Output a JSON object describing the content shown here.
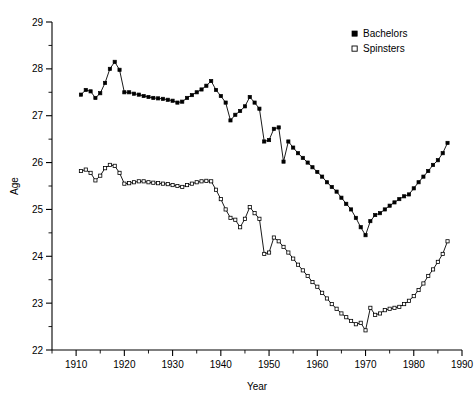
{
  "chart_data": {
    "type": "line",
    "title": "",
    "xlabel": "Year",
    "ylabel": "Age",
    "xlim": [
      1905,
      1990
    ],
    "ylim": [
      22,
      29
    ],
    "grid": false,
    "legend_position": "top-right",
    "x_ticks": [
      1910,
      1920,
      1930,
      1940,
      1950,
      1960,
      1970,
      1980,
      1990
    ],
    "x_minor_step": 5,
    "y_ticks": [
      22,
      23,
      24,
      25,
      26,
      27,
      28,
      29
    ],
    "y_minor_step": 0.5,
    "x": [
      1911,
      1912,
      1913,
      1914,
      1915,
      1916,
      1917,
      1918,
      1919,
      1920,
      1921,
      1922,
      1923,
      1924,
      1925,
      1926,
      1927,
      1928,
      1929,
      1930,
      1931,
      1932,
      1933,
      1934,
      1935,
      1936,
      1937,
      1938,
      1939,
      1940,
      1941,
      1942,
      1943,
      1944,
      1945,
      1946,
      1947,
      1948,
      1949,
      1950,
      1951,
      1952,
      1953,
      1954,
      1955,
      1956,
      1957,
      1958,
      1959,
      1960,
      1961,
      1962,
      1963,
      1964,
      1965,
      1966,
      1967,
      1968,
      1969,
      1970,
      1971,
      1972,
      1973,
      1974,
      1975,
      1976,
      1977,
      1978,
      1979,
      1980,
      1981,
      1982,
      1983,
      1984,
      1985,
      1986,
      1987
    ],
    "series": [
      {
        "name": "Bachelors",
        "marker": "filled-square",
        "color": "#000000",
        "values": [
          27.45,
          27.55,
          27.52,
          27.38,
          27.48,
          27.7,
          28.0,
          28.15,
          27.98,
          27.5,
          27.5,
          27.47,
          27.45,
          27.42,
          27.4,
          27.38,
          27.37,
          27.36,
          27.34,
          27.32,
          27.28,
          27.3,
          27.38,
          27.44,
          27.5,
          27.56,
          27.64,
          27.74,
          27.55,
          27.42,
          27.28,
          26.9,
          27.02,
          27.1,
          27.2,
          27.4,
          27.28,
          27.15,
          26.45,
          26.48,
          26.72,
          26.75,
          26.02,
          26.45,
          26.32,
          26.2,
          26.1,
          26.0,
          25.9,
          25.8,
          25.7,
          25.58,
          25.48,
          25.38,
          25.25,
          25.12,
          25.0,
          24.82,
          24.62,
          24.45,
          24.75,
          24.88,
          24.92,
          25.0,
          25.08,
          25.15,
          25.22,
          25.28,
          25.32,
          25.45,
          25.58,
          25.7,
          25.82,
          25.95,
          26.05,
          26.2,
          26.42
        ]
      },
      {
        "name": "Spinsters",
        "marker": "open-square",
        "color": "#000000",
        "values": [
          25.82,
          25.85,
          25.78,
          25.62,
          25.72,
          25.88,
          25.95,
          25.93,
          25.78,
          25.55,
          25.56,
          25.58,
          25.6,
          25.6,
          25.58,
          25.57,
          25.56,
          25.55,
          25.54,
          25.52,
          25.5,
          25.48,
          25.52,
          25.55,
          25.58,
          25.6,
          25.61,
          25.6,
          25.42,
          25.22,
          25.0,
          24.82,
          24.78,
          24.62,
          24.8,
          25.05,
          24.92,
          24.8,
          24.05,
          24.08,
          24.4,
          24.32,
          24.2,
          24.08,
          23.95,
          23.82,
          23.7,
          23.58,
          23.45,
          23.35,
          23.22,
          23.1,
          22.98,
          22.88,
          22.78,
          22.7,
          22.62,
          22.55,
          22.58,
          22.42,
          22.9,
          22.75,
          22.78,
          22.85,
          22.88,
          22.9,
          22.92,
          22.98,
          23.05,
          23.15,
          23.28,
          23.42,
          23.58,
          23.72,
          23.88,
          24.05,
          24.32
        ]
      }
    ]
  },
  "legend": {
    "entries": [
      {
        "label": "Bachelors",
        "marker": "filled-square"
      },
      {
        "label": "Spinsters",
        "marker": "open-square"
      }
    ]
  },
  "axes": {
    "x_title": "Year",
    "y_title": "Age"
  }
}
